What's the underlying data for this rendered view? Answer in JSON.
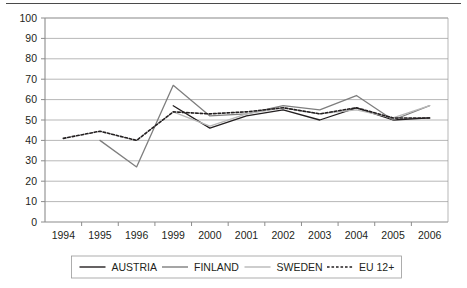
{
  "chart_data": {
    "type": "line",
    "title": "",
    "subtitle": "",
    "xlabel": "",
    "ylabel": "",
    "ylim": [
      0,
      100
    ],
    "ytick_step": 10,
    "yticks": [
      0,
      10,
      20,
      30,
      40,
      50,
      60,
      70,
      80,
      90,
      100
    ],
    "grid": true,
    "grid_axis": "y",
    "legend_position": "bottom",
    "categories": [
      "1994",
      "1995",
      "1996",
      "1999",
      "2000",
      "2001",
      "2002",
      "2003",
      "2004",
      "2005",
      "2006"
    ],
    "series": [
      {
        "name": "AUSTRIA",
        "color": "#231f20",
        "style": "solid",
        "values": [
          null,
          null,
          null,
          57,
          46,
          52,
          55,
          50,
          56,
          50,
          51
        ]
      },
      {
        "name": "FINLAND",
        "color": "#7e7e7e",
        "style": "solid",
        "values": [
          null,
          40,
          27,
          67,
          52,
          53,
          57,
          55,
          62,
          50,
          57
        ]
      },
      {
        "name": "SWEDEN",
        "color": "#b8b8b8",
        "style": "solid",
        "values": [
          null,
          null,
          null,
          54,
          47,
          53,
          56,
          53,
          55,
          51,
          57
        ]
      },
      {
        "name": "EU 12+",
        "color": "#231f20",
        "style": "dashed",
        "values": [
          41,
          44.5,
          40,
          54,
          53,
          54,
          56,
          53,
          56,
          51,
          51
        ]
      }
    ]
  },
  "legend": {
    "items": [
      {
        "label": "AUSTRIA",
        "color": "#231f20",
        "style": "solid"
      },
      {
        "label": "FINLAND",
        "color": "#7e7e7e",
        "style": "solid"
      },
      {
        "label": "SWEDEN",
        "color": "#b8b8b8",
        "style": "solid"
      },
      {
        "label": "EU 12+",
        "color": "#231f20",
        "style": "dashed"
      }
    ]
  }
}
